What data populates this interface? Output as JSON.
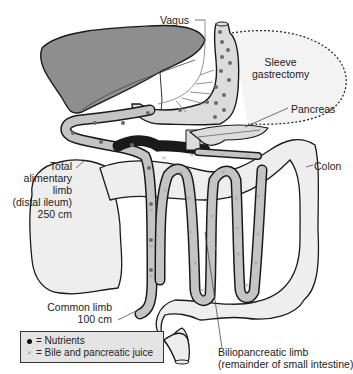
{
  "diagram": {
    "labels": {
      "vagus": "Vagus",
      "sleeve_line1": "Sleeve",
      "sleeve_line2": "gastrectomy",
      "pancreas": "Pancreas",
      "colon": "Colon",
      "alimentary_line1": "Total",
      "alimentary_line2": "alimentary",
      "alimentary_line3": "limb",
      "alimentary_line4": "(distal ileum)",
      "alimentary_line5": "250 cm",
      "common_line1": "Common limb",
      "common_line2": "100 cm",
      "biliopancreatic_line1": "Biliopancreatic limb",
      "biliopancreatic_line2": "(remainder of small intestine)"
    },
    "legend": {
      "items": [
        {
          "symbol": "dot-icon",
          "label": "= Nutrients"
        },
        {
          "symbol": "x-mark-icon",
          "label": "= Bile and pancreatic juice"
        }
      ]
    },
    "colors": {
      "liver": "#8e8e8e",
      "stomach": "#dcdcdc",
      "limb_fill": "#c4c4c4",
      "colon_fill": "#eeeeee",
      "outline": "#1a1a1a",
      "nutrient_dot": "#6a6a6a",
      "bile_mark": "#9a9a9a",
      "legend_bg": "#e4e4e4"
    }
  }
}
